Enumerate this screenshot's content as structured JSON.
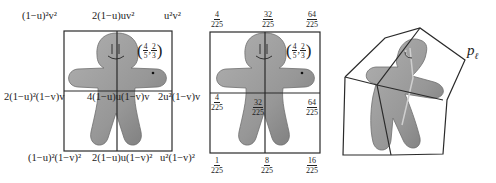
{
  "figure": {
    "panels": [
      {
        "id": "symbolic-weights",
        "top_labels": [
          "(1−u)²v²",
          "2(1−u)uv²",
          "u²v²"
        ],
        "middle_labels": [
          "2(1−u)²(1−v)v",
          "4(1−u)u(1−v)v",
          "2u²(1−v)v"
        ],
        "bottom_labels": [
          "(1−u)²(1−v)²",
          "2(1−u)u(1−v)²",
          "u²(1−v)²"
        ],
        "point": {
          "u_num": "4",
          "u_den": "5",
          "v_num": "2",
          "v_den": "3"
        }
      },
      {
        "id": "numeric-weights",
        "top_labels": [
          {
            "num": "4",
            "den": "225"
          },
          {
            "num": "32",
            "den": "225"
          },
          {
            "num": "64",
            "den": "225"
          }
        ],
        "middle_labels": [
          {
            "num": "4",
            "den": "225"
          },
          {
            "num": "32",
            "den": "225"
          },
          {
            "num": "64",
            "den": "225"
          }
        ],
        "bottom_labels": [
          {
            "num": "1",
            "den": "225"
          },
          {
            "num": "8",
            "den": "225"
          },
          {
            "num": "16",
            "den": "225"
          }
        ],
        "point": {
          "u_num": "4",
          "u_den": "5",
          "v_num": "2",
          "v_den": "3"
        }
      },
      {
        "id": "deformed-grid",
        "control_point_label": "p",
        "control_point_subscript": "ℓ"
      }
    ],
    "colors": {
      "line": "#2a2a2a",
      "figure_fill": "#9a9a9a",
      "figure_shade": "#7d7d7d",
      "background": "#ffffff"
    }
  }
}
